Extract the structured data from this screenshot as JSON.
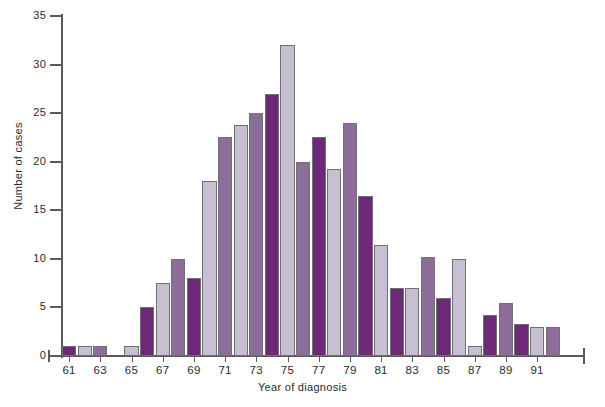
{
  "chart_data": {
    "type": "bar",
    "title": "",
    "subtitle": "",
    "xlabel": "Year of diagnosis",
    "ylabel": "Number of cases",
    "ylim": [
      0,
      35
    ],
    "yticks": [
      0,
      5,
      10,
      15,
      20,
      25,
      30,
      35
    ],
    "ytick_labels": [
      "0",
      "5",
      "10",
      "15",
      "20",
      "25",
      "30",
      "35"
    ],
    "xtick_labels": [
      "61",
      "63",
      "65",
      "67",
      "69",
      "71",
      "73",
      "75",
      "77",
      "79",
      "81",
      "83",
      "85",
      "87",
      "89",
      "91"
    ],
    "grid": false,
    "legend": null,
    "legend_position": "none",
    "categories": [
      "61",
      "62",
      "63",
      "64",
      "65",
      "66",
      "67",
      "68",
      "69",
      "70",
      "71",
      "72",
      "73",
      "74",
      "75",
      "76",
      "77",
      "78",
      "79",
      "80",
      "81",
      "82",
      "83",
      "84",
      "85",
      "86",
      "87",
      "88",
      "89",
      "90",
      "91",
      "92"
    ],
    "values": [
      1,
      1,
      1,
      0,
      1,
      5,
      7.5,
      10,
      8,
      18,
      22.5,
      23.8,
      25,
      27,
      32,
      20,
      22.5,
      19.2,
      24,
      16.5,
      11.4,
      7,
      7,
      10.2,
      6,
      10,
      1,
      4.2,
      5.5,
      3.3,
      3,
      3
    ],
    "bar_colors": [
      "dark",
      "light",
      "medium",
      "none",
      "light",
      "dark",
      "light",
      "medium",
      "dark",
      "light",
      "medium",
      "light",
      "medium",
      "dark",
      "light",
      "medium",
      "dark",
      "light",
      "medium",
      "dark",
      "light",
      "dark",
      "light",
      "medium",
      "dark",
      "light",
      "light",
      "dark",
      "medium",
      "dark",
      "light",
      "medium"
    ],
    "palette": {
      "dark": "#6d2878",
      "medium": "#8d6e9b",
      "light": "#c7c0d2",
      "none": "transparent",
      "outline": "#6f6f74",
      "axis": "#5a5a5a",
      "text": "#2b2b2b",
      "background": "#ffffff"
    }
  }
}
